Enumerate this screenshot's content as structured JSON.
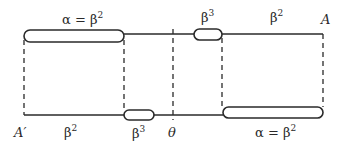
{
  "diagram": {
    "type": "string-worldsheet-diagram",
    "colors": {
      "stroke": "#2a2a2a",
      "background": "#ffffff"
    },
    "top_line": {
      "labels": {
        "left_segment": {
          "base": "α = β",
          "exp": "2"
        },
        "middle_pill": {
          "base": "β",
          "exp": "3"
        },
        "right_segment": {
          "base": "β",
          "exp": "2"
        },
        "end_label": "A"
      }
    },
    "bottom_line": {
      "labels": {
        "start_label": "A′",
        "left_segment": {
          "base": "β",
          "exp": "2"
        },
        "middle_pill": {
          "base": "β",
          "exp": "3"
        },
        "theta_label": "θ",
        "right_segment": {
          "base": "α = β",
          "exp": "2"
        }
      }
    }
  }
}
